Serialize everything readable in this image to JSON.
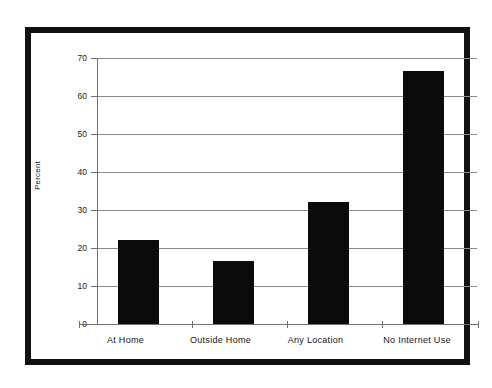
{
  "chart_data": {
    "type": "bar",
    "title": "",
    "xlabel": "",
    "ylabel": "Percent",
    "ylim": [
      0,
      70
    ],
    "ytick_values": [
      70,
      60,
      50,
      40,
      30,
      20,
      10,
      0
    ],
    "ytick_labels": [
      "70",
      "60",
      "50",
      "40",
      "30",
      "20",
      "10",
      "0"
    ],
    "grid": true,
    "legend": "none",
    "bar_color": "#0b0b0b",
    "categories": [
      "At Home",
      "Outside Home",
      "Any Location",
      "No Internet Use"
    ],
    "values": [
      22.0,
      16.6,
      32.0,
      66.5
    ],
    "series": [
      {
        "name": "Percent",
        "values": [
          22.0,
          16.6,
          32.0,
          66.5
        ]
      }
    ]
  },
  "figure": {
    "frame_color": "#111111",
    "background_color": "#ffffff",
    "axis_color": "#6f6f6f",
    "gridline_color": "#8a8a8a"
  }
}
